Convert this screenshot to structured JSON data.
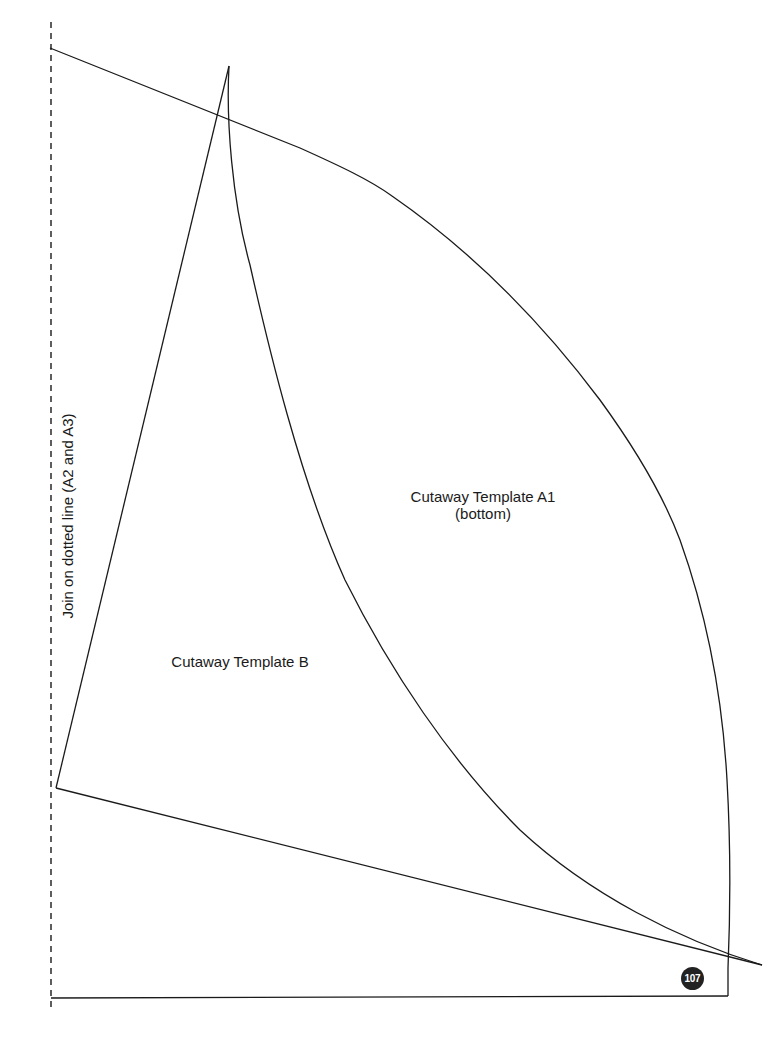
{
  "document": {
    "type": "sewing/craft cutaway template page",
    "join_instruction": "Join on dotted line (A2 and A3)",
    "pieces": [
      {
        "id": "A1",
        "label_line1": "Cutaway Template A1",
        "label_line2": "(bottom)"
      },
      {
        "id": "B",
        "label_line1": "Cutaway Template B"
      }
    ],
    "page_number": "107",
    "colors": {
      "line": "#1a1a1a",
      "badge_bg": "#222222",
      "badge_text": "#ffffff",
      "background": "#ffffff"
    }
  }
}
